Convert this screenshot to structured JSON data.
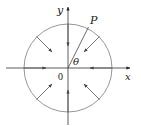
{
  "diagram": {
    "labels": {
      "y_axis": "y",
      "x_axis": "x",
      "point": "P",
      "angle": "θ",
      "origin": "0"
    },
    "colors": {
      "axes": "#333333",
      "circle": "#8a8a8a",
      "arrows": "#555555"
    },
    "circle": {
      "cx": 68,
      "cy": 68,
      "r": 44
    },
    "arrows_inward_count": 8
  }
}
